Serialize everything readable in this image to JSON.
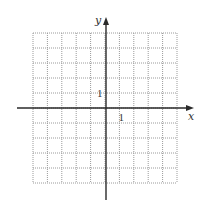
{
  "diagram": {
    "type": "coordinate-plane",
    "grid": {
      "columns": 10,
      "rows": 10,
      "left": 33,
      "top": 33,
      "right": 177,
      "bottom": 183,
      "line_style": "dotted",
      "line_color": "#9a9a9a"
    },
    "axes": {
      "color": "#2a2a2a",
      "origin": {
        "x": 106,
        "y": 108
      },
      "x_axis": {
        "label": "x",
        "start_x": 17,
        "end_x": 194,
        "arrow": "right"
      },
      "y_axis": {
        "label": "y",
        "start_y": 200,
        "end_y": 17,
        "arrow": "up"
      }
    },
    "tick_labels": {
      "x_unit": "1",
      "y_unit": "1"
    }
  },
  "chart_data": {
    "type": "grid",
    "title": "",
    "xlabel": "x",
    "ylabel": "y",
    "xlim": [
      -5,
      5
    ],
    "ylim": [
      -5,
      5
    ],
    "grid": true,
    "grid_style": "dotted",
    "x_tick_labels": [
      {
        "value": 1,
        "label": "1"
      }
    ],
    "y_tick_labels": [
      {
        "value": 1,
        "label": "1"
      }
    ],
    "series": []
  }
}
